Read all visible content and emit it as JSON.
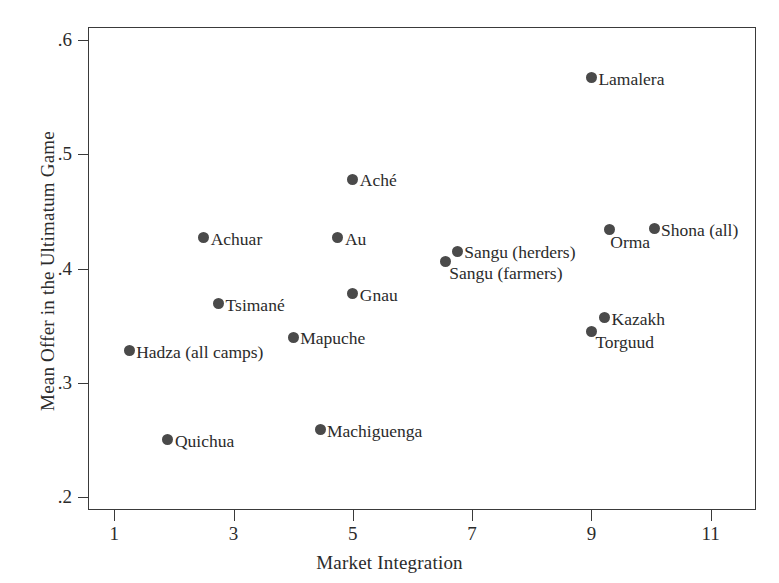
{
  "chart_data": {
    "type": "scatter",
    "title": "",
    "xlabel": "Market Integration",
    "ylabel": "Mean Offer in the Ultimatum Game",
    "xlim": [
      0.56,
      11.76
    ],
    "ylim": [
      0.1885,
      0.6115
    ],
    "xticks": [
      1,
      3,
      5,
      7,
      9,
      11
    ],
    "xticklabels": [
      "1",
      "3",
      "5",
      "7",
      "9",
      "11"
    ],
    "yticks": [
      0.2,
      0.3,
      0.4,
      0.5,
      0.6
    ],
    "yticklabels": [
      ".2",
      ".3",
      ".4",
      ".5",
      ".6"
    ],
    "grid": false,
    "legend": false,
    "marker_color": "#4a4a4a",
    "axis_color": "#3a3a3a",
    "points": [
      {
        "label": "Hadza (all camps)",
        "x": 1.25,
        "y": 0.328,
        "label_pos": "right"
      },
      {
        "label": "Quichua",
        "x": 1.9,
        "y": 0.25,
        "label_pos": "right"
      },
      {
        "label": "Achuar",
        "x": 2.5,
        "y": 0.427,
        "label_pos": "right"
      },
      {
        "label": "Tsimané",
        "x": 2.75,
        "y": 0.369,
        "label_pos": "right"
      },
      {
        "label": "Mapuche",
        "x": 4.0,
        "y": 0.34,
        "label_pos": "right"
      },
      {
        "label": "Machiguenga",
        "x": 4.45,
        "y": 0.259,
        "label_pos": "right"
      },
      {
        "label": "Au",
        "x": 4.75,
        "y": 0.427,
        "label_pos": "right"
      },
      {
        "label": "Aché",
        "x": 5.0,
        "y": 0.478,
        "label_pos": "right"
      },
      {
        "label": "Gnau",
        "x": 5.0,
        "y": 0.378,
        "label_pos": "right"
      },
      {
        "label": "Sangu (farmers)",
        "x": 6.55,
        "y": 0.406,
        "label_pos": "below-right"
      },
      {
        "label": "Sangu (herders)",
        "x": 6.75,
        "y": 0.415,
        "label_pos": "right"
      },
      {
        "label": "Lamalera",
        "x": 9.0,
        "y": 0.567,
        "label_pos": "right"
      },
      {
        "label": "Torguud",
        "x": 9.0,
        "y": 0.345,
        "label_pos": "below-right"
      },
      {
        "label": "Kazakh",
        "x": 9.22,
        "y": 0.357,
        "label_pos": "right"
      },
      {
        "label": "Orma",
        "x": 9.3,
        "y": 0.434,
        "label_pos": "below"
      },
      {
        "label": "Shona (all)",
        "x": 10.05,
        "y": 0.435,
        "label_pos": "right"
      }
    ]
  }
}
